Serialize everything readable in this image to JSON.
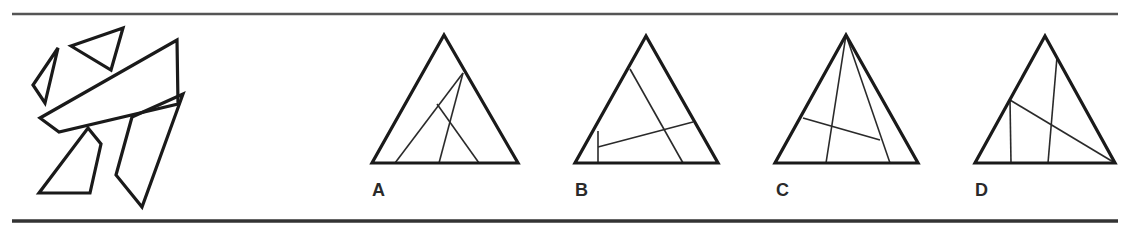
{
  "puzzle": {
    "type": "shape-assembly",
    "rules": {
      "top": {
        "x1": 12,
        "y1": 14,
        "x2": 1118,
        "y2": 14,
        "width": 2.5,
        "color": "#555555"
      },
      "bottom": {
        "x1": 12,
        "y1": 221,
        "x2": 1118,
        "y2": 221,
        "width": 3.5,
        "color": "#333333"
      }
    },
    "stroke_color": "#1a1a1a",
    "pieces": [
      {
        "id": "small-left-triangle",
        "points": [
          [
            58,
            48
          ],
          [
            33,
            85
          ],
          [
            45,
            103
          ]
        ]
      },
      {
        "id": "top-triangle",
        "points": [
          [
            71,
            46
          ],
          [
            123,
            28
          ],
          [
            111,
            70
          ]
        ]
      },
      {
        "id": "long-band",
        "points": [
          [
            40,
            118
          ],
          [
            177,
            40
          ],
          [
            178,
            104
          ],
          [
            59,
            132
          ]
        ]
      },
      {
        "id": "lower-left-quad",
        "points": [
          [
            88,
            128
          ],
          [
            101,
            144
          ],
          [
            90,
            193
          ],
          [
            39,
            193
          ]
        ]
      },
      {
        "id": "lower-right-quad",
        "points": [
          [
            183,
            94
          ],
          [
            142,
            207
          ],
          [
            116,
            175
          ],
          [
            132,
            117
          ]
        ]
      }
    ],
    "options": [
      {
        "label": "A",
        "label_pos": [
          372,
          181
        ],
        "triangle": [
          [
            444,
            35
          ],
          [
            372,
            163
          ],
          [
            518,
            163
          ]
        ],
        "inner_lines": [
          [
            [
              463,
              73
            ],
            [
              395,
              163
            ]
          ],
          [
            [
              463,
              73
            ],
            [
              439,
              163
            ]
          ],
          [
            [
              437,
              104
            ],
            [
              479,
              163
            ]
          ]
        ]
      },
      {
        "label": "B",
        "label_pos": [
          575,
          181
        ],
        "triangle": [
          [
            646,
            36
          ],
          [
            575,
            163
          ],
          [
            718,
            163
          ]
        ],
        "inner_lines": [
          [
            [
              630,
              69
            ],
            [
              683,
              163
            ]
          ],
          [
            [
              598,
              131
            ],
            [
              598,
              163
            ]
          ],
          [
            [
              598,
              147
            ],
            [
              693,
              122
            ]
          ]
        ]
      },
      {
        "label": "C",
        "label_pos": [
          776,
          181
        ],
        "triangle": [
          [
            846,
            35
          ],
          [
            775,
            163
          ],
          [
            918,
            163
          ]
        ],
        "inner_lines": [
          [
            [
              846,
              35
            ],
            [
              826,
              163
            ]
          ],
          [
            [
              846,
              35
            ],
            [
              890,
              163
            ]
          ],
          [
            [
              803,
              118
            ],
            [
              880,
              140
            ]
          ]
        ]
      },
      {
        "label": "D",
        "label_pos": [
          975,
          181
        ],
        "triangle": [
          [
            1045,
            36
          ],
          [
            975,
            163
          ],
          [
            1115,
            163
          ]
        ],
        "inner_lines": [
          [
            [
              1010,
              100
            ],
            [
              1011,
              163
            ]
          ],
          [
            [
              1057,
              57
            ],
            [
              1048,
              163
            ]
          ],
          [
            [
              1010,
              100
            ],
            [
              1115,
              163
            ]
          ]
        ]
      }
    ]
  }
}
